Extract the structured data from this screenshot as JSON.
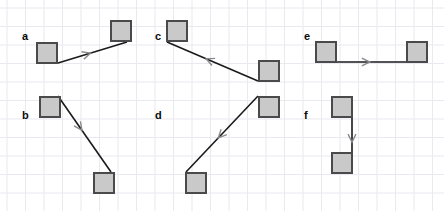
{
  "figure": {
    "width": 444,
    "height": 211,
    "background_color": "#ffffff",
    "grid": {
      "visible": true,
      "line_color": "#e9e9f0",
      "cell_size": 18.5,
      "x_origin": 7,
      "y_origin": 8
    },
    "style": {
      "square_fill": "#c9c9c9",
      "square_stroke": "#4a4a4a",
      "square_stroke_width": 2,
      "square_size": 22,
      "arrow_line_color": "#1a1a1a",
      "arrow_line_width": 1.6,
      "arrowhead_color": "#8a8a8a",
      "arrowhead_width": 1.4,
      "label_color": "#0a0a0a"
    }
  },
  "panels": [
    {
      "id": "a",
      "label": "a",
      "label_x": 22,
      "label_y": 31,
      "squares": [
        {
          "name": "source-square",
          "x": 36,
          "y": 42,
          "size": 22
        },
        {
          "name": "target-square",
          "x": 110,
          "y": 20,
          "size": 22
        }
      ],
      "arrow": {
        "from_x": 58,
        "from_y": 63,
        "to_x": 127,
        "to_y": 42,
        "direction": "right",
        "head_t": 0.47,
        "head_size": 9,
        "head_spread": 26
      }
    },
    {
      "id": "b",
      "label": "b",
      "label_x": 22,
      "label_y": 110,
      "squares": [
        {
          "name": "source-square",
          "x": 39,
          "y": 96,
          "size": 22
        },
        {
          "name": "target-square",
          "x": 93,
          "y": 172,
          "size": 22
        }
      ],
      "arrow": {
        "from_x": 58,
        "from_y": 96,
        "to_x": 111,
        "to_y": 172,
        "direction": "down-right",
        "head_t": 0.45,
        "head_size": 9,
        "head_spread": 26
      }
    },
    {
      "id": "c",
      "label": "c",
      "label_x": 155,
      "label_y": 31,
      "squares": [
        {
          "name": "source-square",
          "x": 166,
          "y": 20,
          "size": 22
        },
        {
          "name": "target-square",
          "x": 258,
          "y": 60,
          "size": 22
        }
      ],
      "arrow": {
        "from_x": 258,
        "from_y": 81,
        "to_x": 167,
        "to_y": 42,
        "direction": "up-left",
        "head_t": 0.57,
        "head_size": 9,
        "head_spread": 26
      }
    },
    {
      "id": "d",
      "label": "d",
      "label_x": 155,
      "label_y": 110,
      "squares": [
        {
          "name": "source-square",
          "x": 258,
          "y": 96,
          "size": 22
        },
        {
          "name": "target-square",
          "x": 185,
          "y": 172,
          "size": 22
        }
      ],
      "arrow": {
        "from_x": 258,
        "from_y": 96,
        "to_x": 186,
        "to_y": 172,
        "direction": "down-left",
        "head_t": 0.55,
        "head_size": 9,
        "head_spread": 26
      }
    },
    {
      "id": "e",
      "label": "e",
      "label_x": 304,
      "label_y": 31,
      "squares": [
        {
          "name": "source-square",
          "x": 315,
          "y": 41,
          "size": 22
        },
        {
          "name": "target-square",
          "x": 406,
          "y": 41,
          "size": 22
        }
      ],
      "arrow": {
        "from_x": 337,
        "from_y": 62,
        "to_x": 407,
        "to_y": 62,
        "direction": "right",
        "head_t": 0.47,
        "head_size": 9,
        "head_spread": 26
      }
    },
    {
      "id": "f",
      "label": "f",
      "label_x": 304,
      "label_y": 110,
      "squares": [
        {
          "name": "source-square",
          "x": 331,
          "y": 96,
          "size": 22
        },
        {
          "name": "target-square",
          "x": 331,
          "y": 152,
          "size": 22
        }
      ],
      "arrow": {
        "from_x": 352,
        "from_y": 117,
        "to_x": 352,
        "to_y": 173,
        "direction": "down",
        "head_t": 0.45,
        "head_size": 9,
        "head_spread": 26
      }
    }
  ]
}
